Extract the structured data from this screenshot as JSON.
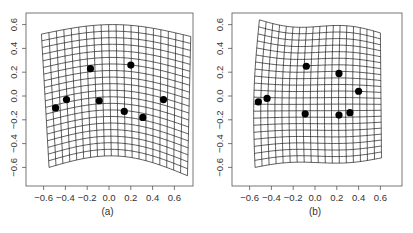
{
  "figure": {
    "background": "#ffffff",
    "frame_color": "#555555",
    "grid_color": "#1a1a1a",
    "point_color": "#000000"
  },
  "chart_data": [
    {
      "type": "scatter",
      "title": "",
      "panel_label": "(a)",
      "description": "Thin-plate spline deformation grid with landmark points",
      "xlabel": "",
      "ylabel": "",
      "xlim": [
        -0.78,
        0.77
      ],
      "ylim": [
        -0.75,
        0.75
      ],
      "xticks": [
        -0.6,
        -0.4,
        -0.2,
        0.0,
        0.2,
        0.4,
        0.6
      ],
      "yticks": [
        -0.6,
        -0.4,
        -0.2,
        0.0,
        0.2,
        0.4,
        0.6
      ],
      "xtick_labels": [
        "-0.6",
        "-0.4",
        "-0.2",
        "0.0",
        "0.2",
        "0.4",
        "0.6"
      ],
      "ytick_labels": [
        "-0.6",
        "-0.4",
        "-0.2",
        "0.0",
        "0.2",
        "0.4",
        "0.6"
      ],
      "grid_on": false,
      "deformation_grid": {
        "columns": 20,
        "rows": 20,
        "corners": {
          "top_left": [
            -0.62,
            0.52
          ],
          "top_right": [
            0.75,
            0.5
          ],
          "bottom_left": [
            -0.55,
            -0.6
          ],
          "bottom_right": [
            0.72,
            -0.67
          ]
        },
        "top_bulge": 0.09,
        "bottom_bulge": 0.13,
        "left_bulge": 0.0,
        "right_bulge": 0.0
      },
      "points": [
        {
          "x": -0.49,
          "y": -0.1
        },
        {
          "x": -0.39,
          "y": -0.03
        },
        {
          "x": -0.17,
          "y": 0.23
        },
        {
          "x": -0.09,
          "y": -0.04
        },
        {
          "x": 0.2,
          "y": 0.26
        },
        {
          "x": 0.14,
          "y": -0.13
        },
        {
          "x": 0.31,
          "y": -0.18
        },
        {
          "x": 0.5,
          "y": -0.03
        }
      ]
    },
    {
      "type": "scatter",
      "title": "",
      "panel_label": "(b)",
      "description": "Thin-plate spline deformation grid with landmark points",
      "xlabel": "",
      "ylabel": "",
      "xlim": [
        -0.76,
        0.8
      ],
      "ylim": [
        -0.75,
        0.75
      ],
      "xticks": [
        -0.6,
        -0.4,
        -0.2,
        0.0,
        0.2,
        0.4,
        0.6
      ],
      "yticks": [
        -0.6,
        -0.4,
        -0.2,
        0.0,
        0.2,
        0.4,
        0.6
      ],
      "xtick_labels": [
        "-0.6",
        "-0.4",
        "-0.2",
        "0.0",
        "0.2",
        "0.4",
        "0.6"
      ],
      "ytick_labels": [
        "-0.6",
        "-0.4",
        "-0.2",
        "0.0",
        "0.2",
        "0.4",
        "0.6"
      ],
      "grid_on": false,
      "deformation_grid": {
        "columns": 18,
        "rows": 21,
        "corners": {
          "top_left": [
            -0.51,
            0.64
          ],
          "top_right": [
            0.6,
            0.53
          ],
          "bottom_left": [
            -0.55,
            -0.6
          ],
          "bottom_right": [
            0.61,
            -0.52
          ]
        },
        "top_bulge": 0.0,
        "bottom_bulge": 0.0,
        "top_wave": -0.03,
        "bottom_wave": 0.02,
        "left_bulge": -0.03,
        "right_bulge": 0.0
      },
      "points": [
        {
          "x": -0.52,
          "y": -0.05
        },
        {
          "x": -0.44,
          "y": -0.02
        },
        {
          "x": -0.08,
          "y": 0.25
        },
        {
          "x": 0.22,
          "y": 0.19
        },
        {
          "x": 0.4,
          "y": 0.04
        },
        {
          "x": -0.09,
          "y": -0.15
        },
        {
          "x": 0.22,
          "y": -0.16
        },
        {
          "x": 0.32,
          "y": -0.14
        }
      ]
    }
  ],
  "panels": [
    {
      "label": "(a)",
      "frame": {
        "left": 26,
        "top": 13,
        "right": 193,
        "bottom": 186
      },
      "origin_px": [
        109,
        96
      ],
      "px_per_unit": [
        109,
        119
      ]
    },
    {
      "label": "(b)",
      "frame": {
        "left": 232,
        "top": 13,
        "right": 402,
        "bottom": 186
      },
      "origin_px": [
        315,
        96
      ],
      "px_per_unit": [
        109,
        119
      ]
    }
  ]
}
